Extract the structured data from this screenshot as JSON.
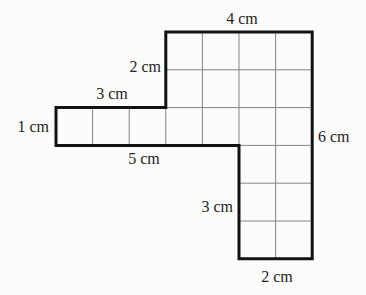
{
  "figure": {
    "background_color": "#fcfcfb",
    "outline_color": "#121212",
    "grid_line_color": "#848484",
    "label_color": "#242424",
    "scale": {
      "origin_x": 56,
      "origin_y": 32,
      "unit_x": 36.6,
      "unit_y": 37.8
    },
    "outline_units": [
      [
        3,
        0
      ],
      [
        7,
        0
      ],
      [
        7,
        6
      ],
      [
        5,
        6
      ],
      [
        5,
        3
      ],
      [
        0,
        3
      ],
      [
        0,
        2
      ],
      [
        3,
        2
      ]
    ],
    "grid_vertical": [
      {
        "x": 1,
        "y1": 2,
        "y2": 3
      },
      {
        "x": 2,
        "y1": 2,
        "y2": 3
      },
      {
        "x": 3,
        "y1": 2,
        "y2": 3
      },
      {
        "x": 4,
        "y1": 0,
        "y2": 3
      },
      {
        "x": 5,
        "y1": 0,
        "y2": 3
      },
      {
        "x": 6,
        "y1": 0,
        "y2": 6
      }
    ],
    "grid_horizontal": [
      {
        "y": 1,
        "x1": 3,
        "x2": 7
      },
      {
        "y": 2,
        "x1": 3,
        "x2": 7
      },
      {
        "y": 3,
        "x1": 5,
        "x2": 7
      },
      {
        "y": 4,
        "x1": 5,
        "x2": 7
      },
      {
        "y": 5,
        "x1": 5,
        "x2": 7
      }
    ],
    "labels": [
      {
        "text": "4 cm",
        "x": 242,
        "y": 19,
        "align": "center"
      },
      {
        "text": "2 cm",
        "x": 161,
        "y": 67,
        "align": "right"
      },
      {
        "text": "3 cm",
        "x": 112,
        "y": 94,
        "align": "center"
      },
      {
        "text": "1 cm",
        "x": 49,
        "y": 127,
        "align": "right"
      },
      {
        "text": "5 cm",
        "x": 144,
        "y": 159,
        "align": "center"
      },
      {
        "text": "6 cm",
        "x": 318,
        "y": 137,
        "align": "left"
      },
      {
        "text": "3 cm",
        "x": 233,
        "y": 207,
        "align": "right"
      },
      {
        "text": "2 cm",
        "x": 277,
        "y": 277,
        "align": "center"
      }
    ]
  }
}
